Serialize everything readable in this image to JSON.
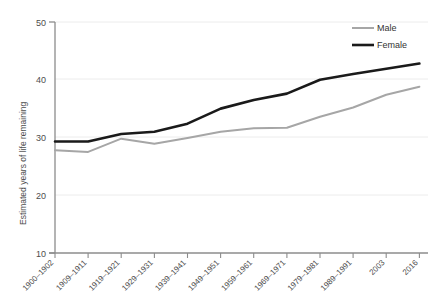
{
  "chart_data": {
    "type": "line",
    "title": "",
    "xlabel": "",
    "ylabel": "Estimated years of life remaining",
    "categories": [
      "1900–1902",
      "1909–1911",
      "1919–1921",
      "1929–1931",
      "1939–1941",
      "1949–1951",
      "1959–1961",
      "1969–1971",
      "1979–1981",
      "1989–1991",
      "2003",
      "2016"
    ],
    "series": [
      {
        "name": "Male",
        "color": "#a6a6a6",
        "values": [
          27.8,
          27.5,
          29.8,
          28.9,
          29.9,
          31.0,
          31.6,
          31.7,
          33.6,
          35.2,
          37.4,
          38.8
        ]
      },
      {
        "name": "Female",
        "color": "#1a1a1a",
        "values": [
          29.3,
          29.3,
          30.6,
          31.0,
          32.4,
          35.0,
          36.5,
          37.6,
          40.0,
          41.0,
          41.9,
          42.8
        ]
      }
    ],
    "ylim": [
      10,
      50
    ],
    "yticks": [
      10,
      20,
      30,
      40,
      50
    ],
    "ytick_labels": [
      "10",
      "20",
      "30",
      "40",
      "50"
    ],
    "grid": true,
    "grid_axis": "y",
    "legend_position": "top-right",
    "legend_entries": [
      "Male",
      "Female"
    ]
  },
  "axes": {
    "y_axis_title": "Estimated years of life remaining",
    "y_tick_0": "50",
    "y_tick_1": "40",
    "y_tick_2": "30",
    "y_tick_3": "20",
    "y_tick_4": "10"
  },
  "legend": {
    "male_label": "Male",
    "female_label": "Female"
  },
  "xlabels": {
    "t0": "1900–1902",
    "t1": "1909–1911",
    "t2": "1919–1921",
    "t3": "1929–1931",
    "t4": "1939–1941",
    "t5": "1949–1951",
    "t6": "1959–1961",
    "t7": "1969–1971",
    "t8": "1979–1981",
    "t9": "1989–1991",
    "t10": "2003",
    "t11": "2016"
  },
  "colors": {
    "male_line": "#a6a6a6",
    "female_line": "#1a1a1a",
    "axis": "#808080",
    "grid": "#e8e8e8",
    "text": "#4d4d4d"
  }
}
